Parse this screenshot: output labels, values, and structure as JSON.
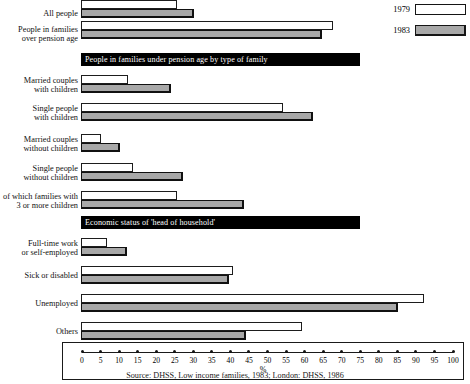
{
  "legend": {
    "items": [
      {
        "label": "1979",
        "swatch": "white-outline"
      },
      {
        "label": "1983",
        "swatch": "grey-filled"
      }
    ]
  },
  "axis": {
    "title": "%",
    "ticks": [
      0,
      5,
      10,
      15,
      20,
      25,
      30,
      35,
      40,
      45,
      50,
      55,
      60,
      65,
      70,
      75,
      80,
      85,
      90,
      95,
      100
    ]
  },
  "bands": [
    {
      "id": "band-family-type",
      "text": "People in families under pension age by type of family"
    },
    {
      "id": "band-economic-status",
      "text": "Economic status of 'head of household'"
    }
  ],
  "source": "Source: DHSS, Low income families, 1983; London: DHSS, 1986",
  "chart_data": {
    "type": "bar",
    "orientation": "horizontal",
    "title": "",
    "xlabel": "%",
    "ylabel": "",
    "xlim": [
      0,
      100
    ],
    "grid": false,
    "legend_position": "top-right",
    "categories": [
      "All people",
      "People in families\nover pension age",
      "Married couples\nwith children",
      "Single people\nwith children",
      "Married couples\nwithout children",
      "Single people\nwithout children",
      "of which families with\n3 or more children",
      "Full-time work\nor self-employed",
      "Sick or disabled",
      "Unemployed",
      "Others"
    ],
    "series": [
      {
        "name": "1979",
        "values": [
          26.0,
          68.0,
          12.7,
          54.5,
          5.4,
          14.0,
          26.0,
          7.0,
          41.0,
          92.5,
          59.5
        ]
      },
      {
        "name": "1983",
        "values": [
          30.5,
          65.0,
          24.3,
          62.5,
          10.5,
          27.5,
          44.0,
          12.4,
          40.0,
          85.5,
          44.5
        ]
      }
    ]
  }
}
